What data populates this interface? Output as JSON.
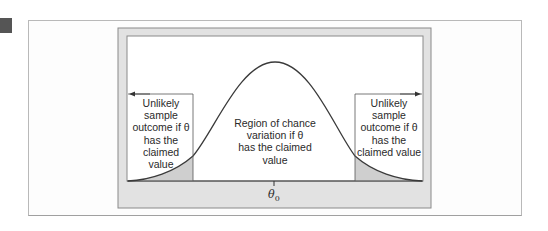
{
  "figure": {
    "marker_color": "#555555",
    "frame_color": "#e2e2e2",
    "tail_shade_color": "#cfcfcf",
    "curve_color": "#3a3a3a",
    "curve_type": "normal-density",
    "axis_label": {
      "symbol": "θ",
      "subscript": "0"
    }
  },
  "regions": {
    "left": {
      "lines": [
        "Unlikely",
        "sample",
        "outcome if θ",
        "has the",
        "claimed value"
      ],
      "arrow": "left"
    },
    "center": {
      "lines": [
        "Region of chance",
        "variation if θ",
        "has the claimed",
        "value"
      ]
    },
    "right": {
      "lines": [
        "Unlikely",
        "sample",
        "outcome if θ",
        "has the",
        "claimed value"
      ],
      "arrow": "right"
    }
  }
}
